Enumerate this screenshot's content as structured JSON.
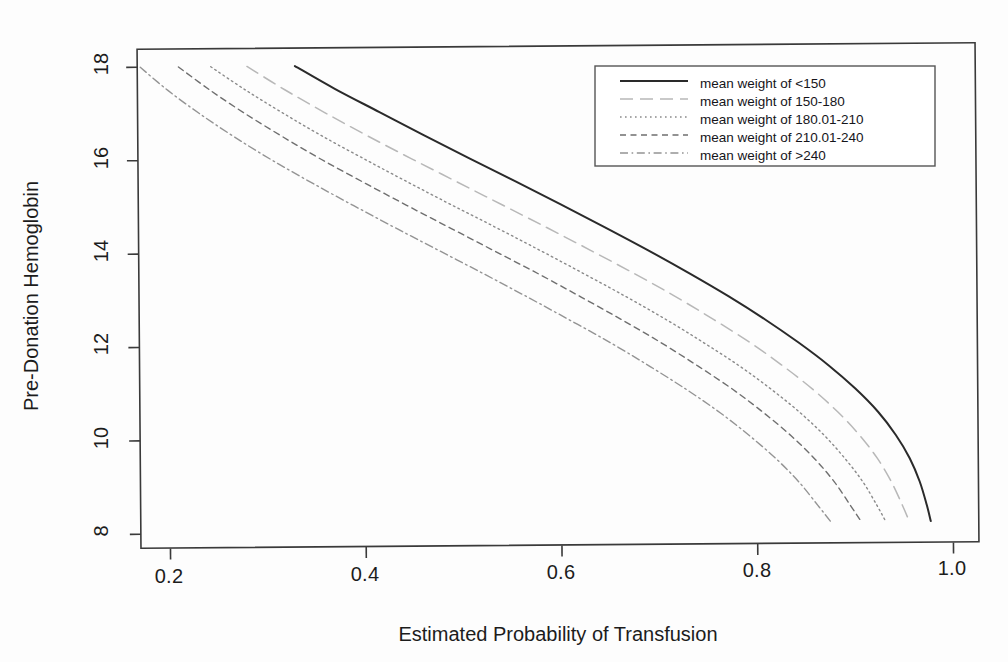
{
  "chart_data": {
    "type": "line",
    "title": "",
    "xlabel": "Estimated Probability of Transfusion",
    "ylabel": "Pre-Donation Hemoglobin",
    "xlim": [
      0.155,
      1.04
    ],
    "ylim": [
      7.72,
      18.45
    ],
    "xticks": [
      0.2,
      0.4,
      0.6,
      0.8,
      1.0
    ],
    "xticklabels": [
      "0.2",
      "0.4",
      "0.6",
      "0.8",
      "1.0"
    ],
    "yticks": [
      8,
      10,
      12,
      14,
      16,
      18
    ],
    "yticklabels": [
      "8",
      "10",
      "12",
      "14",
      "16",
      "18"
    ],
    "grid": false,
    "legend_position": "top-right",
    "series": [
      {
        "name": "mean weight of <150",
        "linestyle": "solid",
        "color": "#2a2a2a",
        "x": [
          0.331,
          0.372,
          0.417,
          0.462,
          0.508,
          0.555,
          0.601,
          0.646,
          0.69,
          0.732,
          0.772,
          0.809,
          0.843,
          0.874,
          0.901,
          0.924,
          0.942,
          0.956,
          0.966,
          0.973,
          0.977
        ],
        "y": [
          18.0,
          17.5,
          17.0,
          16.5,
          16.0,
          15.5,
          15.0,
          14.5,
          14.0,
          13.5,
          13.0,
          12.5,
          12.0,
          11.5,
          11.0,
          10.5,
          10.0,
          9.5,
          9.0,
          8.5,
          8.15
        ]
      },
      {
        "name": "mean weight of 150-180",
        "linestyle": "longdash",
        "color": "#b8b8b8",
        "x": [
          0.282,
          0.32,
          0.361,
          0.404,
          0.449,
          0.495,
          0.541,
          0.587,
          0.632,
          0.676,
          0.718,
          0.757,
          0.794,
          0.827,
          0.857,
          0.883,
          0.905,
          0.923,
          0.937,
          0.948,
          0.955
        ],
        "y": [
          18.0,
          17.5,
          17.0,
          16.5,
          16.0,
          15.5,
          15.0,
          14.5,
          14.0,
          13.5,
          13.0,
          12.5,
          12.0,
          11.5,
          11.0,
          10.5,
          10.0,
          9.5,
          9.0,
          8.5,
          8.15
        ]
      },
      {
        "name": "mean weight of 180.01-210",
        "linestyle": "dotted",
        "color": "#8a8a8a",
        "x": [
          0.245,
          0.28,
          0.318,
          0.358,
          0.401,
          0.445,
          0.49,
          0.536,
          0.581,
          0.625,
          0.668,
          0.709,
          0.747,
          0.783,
          0.815,
          0.844,
          0.869,
          0.89,
          0.908,
          0.922,
          0.931
        ],
        "y": [
          18.0,
          17.5,
          17.0,
          16.5,
          16.0,
          15.5,
          15.0,
          14.5,
          14.0,
          13.5,
          13.0,
          12.5,
          12.0,
          11.5,
          11.0,
          10.5,
          10.0,
          9.5,
          9.0,
          8.5,
          8.15
        ]
      },
      {
        "name": "mean weight of 210.01-240",
        "linestyle": "dashed",
        "color": "#6f6f6f",
        "x": [
          0.212,
          0.244,
          0.279,
          0.317,
          0.357,
          0.4,
          0.444,
          0.489,
          0.534,
          0.579,
          0.622,
          0.664,
          0.704,
          0.741,
          0.776,
          0.807,
          0.835,
          0.859,
          0.879,
          0.895,
          0.906
        ],
        "y": [
          18.0,
          17.5,
          17.0,
          16.5,
          16.0,
          15.5,
          15.0,
          14.5,
          14.0,
          13.5,
          13.0,
          12.5,
          12.0,
          11.5,
          11.0,
          10.5,
          10.0,
          9.5,
          9.0,
          8.5,
          8.15
        ]
      },
      {
        "name": "mean weight of >240",
        "linestyle": "dashdot",
        "color": "#949494",
        "x": [
          0.173,
          0.201,
          0.233,
          0.268,
          0.306,
          0.347,
          0.39,
          0.434,
          0.479,
          0.524,
          0.568,
          0.611,
          0.653,
          0.692,
          0.729,
          0.763,
          0.793,
          0.82,
          0.843,
          0.862,
          0.875
        ],
        "y": [
          18.0,
          17.5,
          17.0,
          16.5,
          16.0,
          15.5,
          15.0,
          14.5,
          14.0,
          13.5,
          13.0,
          12.5,
          12.0,
          11.5,
          11.0,
          10.5,
          10.0,
          9.5,
          9.0,
          8.5,
          8.15
        ]
      }
    ]
  },
  "axes": {
    "x_title": "Estimated Probability of Transfusion",
    "y_title": "Pre-Donation Hemoglobin",
    "x_tick_labels": [
      "0.2",
      "0.4",
      "0.6",
      "0.8",
      "1.0"
    ],
    "y_tick_labels": [
      "8",
      "10",
      "12",
      "14",
      "16",
      "18"
    ]
  },
  "legend": {
    "entries": [
      {
        "label": "mean weight of <150",
        "style": "solid"
      },
      {
        "label": "mean weight of 150-180",
        "style": "longdash"
      },
      {
        "label": "mean weight of 180.01-210",
        "style": "dotted"
      },
      {
        "label": "mean weight of 210.01-240",
        "style": "dashed"
      },
      {
        "label": "mean weight of >240",
        "style": "dashdot"
      }
    ]
  },
  "colors": {
    "frame": "#3a3a3a",
    "text": "#1c1c1c",
    "background": "#fdfdfd",
    "primary_line": "#2a2a2a"
  }
}
